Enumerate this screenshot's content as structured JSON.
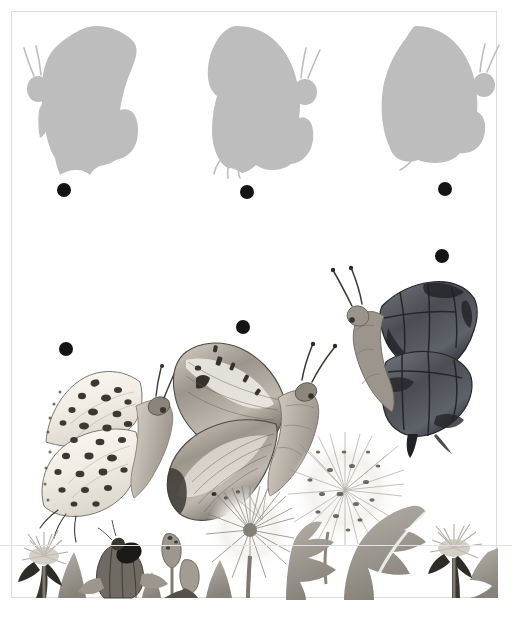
{
  "page": {
    "type": "illustrated-activity-page",
    "background_color": "#ffffff",
    "frame_color": "#dcdcdc",
    "silhouette_color": "#bdbdbd",
    "dot_color": "#141414",
    "ink_color": "#5a5a5a",
    "frame": {
      "x": 11,
      "y": 11,
      "width": 486,
      "height": 587
    },
    "fold_line_y": 545
  },
  "silhouettes": {
    "label": "butterfly-silhouette-row",
    "count": 3,
    "items": [
      {
        "name": "silhouette-1",
        "description": "grey butterfly silhouette, head and antennae at upper left, angular wing",
        "x": 18,
        "y": 24,
        "width": 122,
        "height": 150,
        "facing": "left",
        "matches": "butterfly-dark-comma"
      },
      {
        "name": "silhouette-2",
        "description": "grey butterfly silhouette, head and antennae at upper right, rounded wing",
        "x": 205,
        "y": 24,
        "width": 120,
        "height": 150,
        "facing": "right",
        "matches": "butterfly-painted-lady"
      },
      {
        "name": "silhouette-3",
        "description": "grey butterfly silhouette, head and antennae at upper right, broad wing",
        "x": 380,
        "y": 24,
        "width": 118,
        "height": 142,
        "facing": "right",
        "matches": "butterfly-spotted-fritillary"
      }
    ]
  },
  "dots": {
    "label": "connector-dots",
    "radius": 7,
    "items": [
      {
        "name": "dot-silhouette-1",
        "x": 64,
        "y": 190,
        "belongs_to": "silhouette-1"
      },
      {
        "name": "dot-silhouette-2",
        "x": 247,
        "y": 192,
        "belongs_to": "silhouette-2"
      },
      {
        "name": "dot-silhouette-3",
        "x": 445,
        "y": 189,
        "belongs_to": "silhouette-3"
      },
      {
        "name": "dot-butterfly-dark",
        "x": 442,
        "y": 256,
        "belongs_to": "butterfly-dark-comma"
      },
      {
        "name": "dot-butterfly-painted",
        "x": 243,
        "y": 327,
        "belongs_to": "butterfly-painted-lady"
      },
      {
        "name": "dot-butterfly-spotted",
        "x": 66,
        "y": 349,
        "belongs_to": "butterfly-spotted-fritillary"
      }
    ]
  },
  "butterflies": {
    "label": "watercolour-butterfly-row",
    "count": 3,
    "items": [
      {
        "name": "butterfly-spotted-fritillary",
        "description": "pale cream watercolour butterfly with dark round spots, body facing right",
        "x": 38,
        "y": 366,
        "width": 135,
        "height": 160,
        "palette": [
          "#f4f1ea",
          "#6e6a63",
          "#2e2c29"
        ]
      },
      {
        "name": "butterfly-painted-lady",
        "description": "mottled grey-brown watercolour butterfly with banded forewing, facing right",
        "x": 168,
        "y": 342,
        "width": 140,
        "height": 170,
        "palette": [
          "#e8e4dd",
          "#7d7871",
          "#3a3733"
        ]
      },
      {
        "name": "butterfly-dark-comma",
        "description": "dark slate watercolour butterfly with angular wing, facing left",
        "x": 336,
        "y": 272,
        "width": 150,
        "height": 180,
        "palette": [
          "#8d9095",
          "#4e5156",
          "#24262a"
        ]
      }
    ]
  },
  "meadow": {
    "label": "dandelion-meadow-border",
    "description": "watercolour band of dandelion flowers, buds, seed heads and leaves along the bottom edge",
    "y": 470,
    "height": 128,
    "elements": [
      {
        "name": "dandelion-flower-left",
        "x": 42,
        "y": 540
      },
      {
        "name": "dandelion-leaf-spear-1",
        "x": 72,
        "y": 555
      },
      {
        "name": "dandelion-bud-dark",
        "x": 110,
        "y": 538
      },
      {
        "name": "dandelion-bud-small",
        "x": 163,
        "y": 535
      },
      {
        "name": "dandelion-bud-tiny",
        "x": 180,
        "y": 560
      },
      {
        "name": "dandelion-leaf-spear-2",
        "x": 218,
        "y": 560
      },
      {
        "name": "dandelion-seedhead-mid",
        "x": 232,
        "y": 492
      },
      {
        "name": "dandelion-seedhead-large",
        "x": 300,
        "y": 432
      },
      {
        "name": "dandelion-leaf-big-1",
        "x": 292,
        "y": 525
      },
      {
        "name": "dandelion-leaf-big-2",
        "x": 355,
        "y": 520
      },
      {
        "name": "dandelion-flower-right",
        "x": 452,
        "y": 540
      },
      {
        "name": "dandelion-leaf-spear-3",
        "x": 480,
        "y": 555
      }
    ]
  }
}
